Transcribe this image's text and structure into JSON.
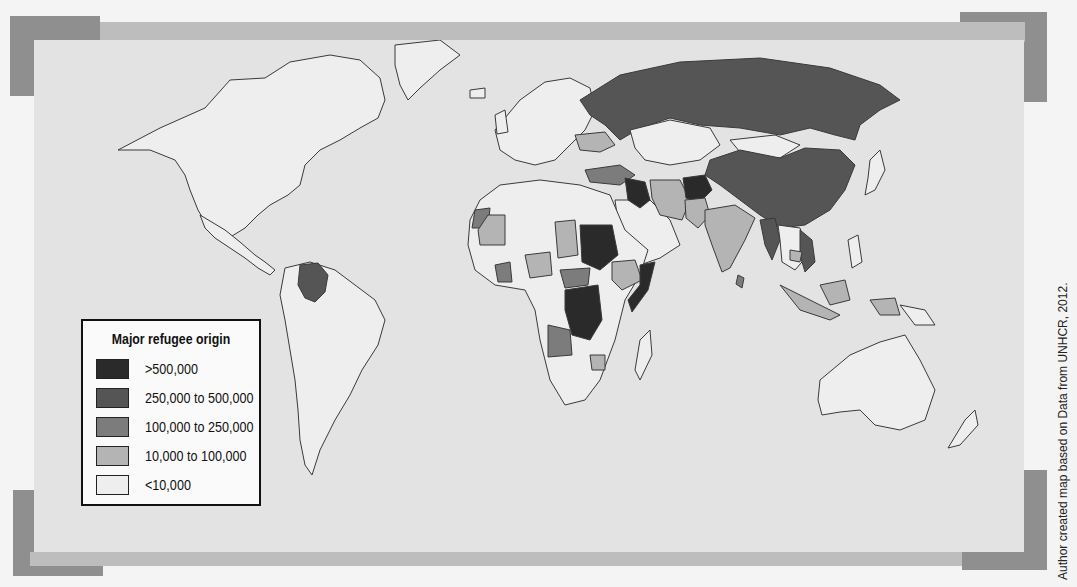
{
  "map": {
    "type": "choropleth-world",
    "projection": "world (Robinson-like)",
    "background_colors": {
      "ocean": "#e3e3e3",
      "frame_dark": "#8f8f8f",
      "frame_light": "#bdbdbd",
      "border": "#3a3a3a"
    }
  },
  "legend": {
    "title": "Major refugee origin",
    "items": [
      {
        "label": ">500,000",
        "color": "#2a2a2a"
      },
      {
        "label": "250,000 to 500,000",
        "color": "#555555"
      },
      {
        "label": "100,000 to 250,000",
        "color": "#7c7c7c"
      },
      {
        "label": "10,000 to 100,000",
        "color": "#b4b4b4"
      },
      {
        "label": "<10,000",
        "color": "#eeeeee"
      }
    ]
  },
  "highlighted_regions": {
    "over_500k": [
      "Afghanistan",
      "Iraq",
      "Sudan",
      "Somalia",
      "DR Congo"
    ],
    "250k_to_500k": [
      "Russia",
      "China",
      "Colombia",
      "Myanmar",
      "Vietnam"
    ],
    "100k_to_250k": [
      "Turkey",
      "Angola",
      "Western Sahara",
      "Cote d'Ivoire",
      "Central African Republic",
      "Bosnia/Serbia",
      "Sri Lanka (partial)"
    ],
    "10k_to_100k": [
      "Iran",
      "Pakistan",
      "India",
      "Ukraine",
      "Mauritania",
      "Nigeria",
      "Chad",
      "Ethiopia",
      "Eritrea",
      "Zimbabwe",
      "Indonesia",
      "Cambodia",
      "Papua"
    ]
  },
  "credit": "Author created map based on Data from UNHCR, 2012."
}
